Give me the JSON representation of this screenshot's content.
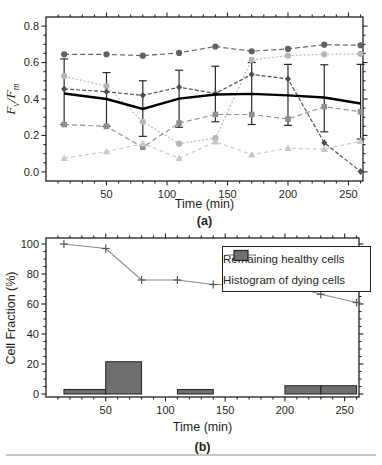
{
  "page": {
    "background": "#ffffff",
    "divider_color": "#c6c6c6"
  },
  "chart_data": [
    {
      "type": "line",
      "id": "a",
      "sublabel": "(a)",
      "xlabel": "Time (min)",
      "ylabel_parts": {
        "F1": "F",
        "v": "v",
        "slash": "/",
        "F2": "F",
        "m": "m"
      },
      "xlim": [
        0,
        262
      ],
      "ylim": [
        -0.05,
        0.85
      ],
      "xticks": [
        50,
        100,
        150,
        200,
        250
      ],
      "xticklabels": [
        "50",
        "100",
        "150",
        "200",
        "250"
      ],
      "x_minor_step": 10,
      "yticks": [
        0.0,
        0.2,
        0.4,
        0.6,
        0.8
      ],
      "yticklabels": [
        "0.0",
        "0.2",
        "0.4",
        "0.6",
        "0.8"
      ],
      "y_minor_step": 0.05,
      "grid": false,
      "x": [
        15,
        50,
        80,
        110,
        140,
        170,
        200,
        230,
        260
      ],
      "series": [
        {
          "name": "cell-dark-circles",
          "marker": "circle",
          "color": "#616161",
          "dash": "5,3",
          "values": [
            0.645,
            0.645,
            0.638,
            0.653,
            0.688,
            0.662,
            0.675,
            0.698,
            0.695
          ]
        },
        {
          "name": "cell-light-circles",
          "marker": "circle",
          "color": "#b6b6b6",
          "dash": "2,2",
          "values": [
            0.525,
            0.47,
            0.275,
            0.155,
            0.185,
            0.615,
            0.638,
            0.645,
            0.648
          ]
        },
        {
          "name": "cell-squares",
          "marker": "square",
          "color": "#8f8f8f",
          "dash": "5,3",
          "values": [
            0.26,
            0.25,
            0.135,
            0.268,
            0.315,
            0.315,
            0.29,
            0.358,
            0.33
          ]
        },
        {
          "name": "cell-triangles",
          "marker": "triangle",
          "color": "#c8c8c8",
          "dash": "4,3",
          "values": [
            0.075,
            0.112,
            0.155,
            0.075,
            0.165,
            0.095,
            0.13,
            0.125,
            0.168
          ]
        },
        {
          "name": "cell-diamonds",
          "marker": "diamond",
          "color": "#4e4e4e",
          "dash": "4,2",
          "values": [
            0.455,
            0.44,
            0.42,
            0.465,
            0.43,
            0.535,
            0.51,
            0.16,
            0.002
          ]
        },
        {
          "name": "mean",
          "marker": "none",
          "color": "#000000",
          "dash": "",
          "width": 2.4,
          "values": [
            0.43,
            0.4,
            0.345,
            0.402,
            0.425,
            0.428,
            0.42,
            0.408,
            0.375
          ],
          "error_low": [
            0.26,
            0.25,
            0.195,
            0.245,
            0.275,
            0.26,
            0.255,
            0.22,
            0.18
          ],
          "error_high": [
            0.62,
            0.545,
            0.5,
            0.558,
            0.58,
            0.6,
            0.59,
            0.588,
            0.59
          ],
          "error_color": "#2b2b2b"
        }
      ]
    },
    {
      "type": "line+bar",
      "id": "b",
      "sublabel": "(b)",
      "xlabel": "Time (min)",
      "ylabel": "Cell Fraction (%)",
      "xlim": [
        0,
        262
      ],
      "ylim": [
        -2,
        104
      ],
      "xticks": [
        50,
        100,
        150,
        200,
        250
      ],
      "xticklabels": [
        "50",
        "100",
        "150",
        "200",
        "250"
      ],
      "x_minor_step": 10,
      "yticks": [
        0,
        20,
        40,
        60,
        80,
        100
      ],
      "yticklabels": [
        "0",
        "20",
        "40",
        "60",
        "80",
        "100"
      ],
      "y_minor_step": 5,
      "grid": false,
      "legend": {
        "position": "upper right",
        "items": [
          {
            "label": "Remaining healthy cells",
            "marker": "plus-line",
            "color": "#8a8a8a"
          },
          {
            "label": "Histogram of dying cells",
            "marker": "filled-square",
            "color": "#6f6f6f"
          }
        ]
      },
      "line": {
        "name": "remaining-healthy-cells",
        "marker": "plus",
        "color": "#8a8a8a",
        "marker_color": "#555555",
        "x": [
          15,
          50,
          80,
          110,
          140,
          170,
          200,
          230,
          260
        ],
        "values": [
          100,
          97,
          76,
          76,
          73,
          73,
          73.5,
          66.5,
          61
        ]
      },
      "bars": {
        "name": "histogram-of-dying-cells",
        "fill": "#6f6f6f",
        "stroke": "#222222",
        "segments": [
          {
            "x0": 15,
            "x1": 50,
            "height": 3
          },
          {
            "x0": 50,
            "x1": 80,
            "height": 21.5
          },
          {
            "x0": 110,
            "x1": 140,
            "height": 3
          },
          {
            "x0": 200,
            "x1": 230,
            "height": 5.5
          },
          {
            "x0": 230,
            "x1": 260,
            "height": 5.5
          }
        ]
      }
    }
  ]
}
